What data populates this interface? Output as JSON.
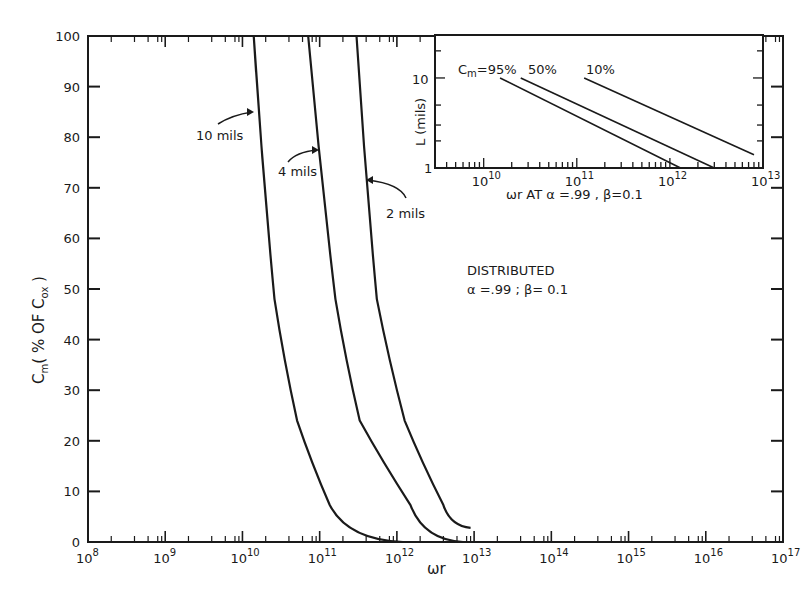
{
  "chart_data": [
    {
      "id": "main",
      "type": "line",
      "title": "",
      "xlabel": "ωr",
      "ylabel": "Cm ( % OF Cox )",
      "xscale": "log",
      "xlim": [
        100000000.0,
        1e+17
      ],
      "ylim": [
        0,
        100
      ],
      "xticks": [
        "10^8",
        "10^9",
        "10^10",
        "10^11",
        "10^12",
        "10^13",
        "10^14",
        "10^15",
        "10^16",
        "10^17"
      ],
      "yticks": [
        0,
        10,
        20,
        30,
        40,
        50,
        60,
        70,
        80,
        90,
        100
      ],
      "grid": false,
      "annotation": {
        "line1": "DISTRIBUTED",
        "line2": "α =.99 ; β= 0.1"
      },
      "series": [
        {
          "name": "10 mils",
          "points": [
            [
              14000000000.0,
              100
            ],
            [
              26000000000.0,
              48
            ],
            [
              51000000000.0,
              24
            ],
            [
              135000000000.0,
              7.3
            ],
            [
              1200000000000.0,
              0
            ]
          ]
        },
        {
          "name": "4 mils",
          "points": [
            [
              71000000000.0,
              100
            ],
            [
              160000000000.0,
              48
            ],
            [
              330000000000.0,
              24
            ],
            [
              1500000000000.0,
              7.3
            ],
            [
              7200000000000.0,
              0
            ]
          ]
        },
        {
          "name": "2 mils",
          "points": [
            [
              300000000000.0,
              100
            ],
            [
              550000000000.0,
              48
            ],
            [
              1260000000000.0,
              24
            ],
            [
              4000000000000.0,
              7.3
            ],
            [
              9000000000000.0,
              2.8
            ]
          ]
        }
      ]
    },
    {
      "id": "inset",
      "type": "line",
      "title": "",
      "xlabel": "ωr AT α =.99 , β=0.1",
      "ylabel": "L (mils)",
      "xscale": "log",
      "yscale": "log",
      "xlim": [
        3000000000.0,
        10000000000000.0
      ],
      "ylim": [
        1,
        30
      ],
      "xticks": [
        "10^10",
        "10^11",
        "10^12",
        "10^13"
      ],
      "yticks": [
        "1",
        "10"
      ],
      "series": [
        {
          "name": "Cm=95%",
          "points": [
            [
              15000000000.0,
              10
            ],
            [
              1300000000000.0,
              1
            ]
          ]
        },
        {
          "name": "50%",
          "points": [
            [
              25000000000.0,
              10
            ],
            [
              3000000000000.0,
              1
            ]
          ]
        },
        {
          "name": "10%",
          "points": [
            [
              120000000000.0,
              10
            ],
            [
              8000000000000.0,
              1.4
            ]
          ]
        }
      ]
    }
  ],
  "labels": {
    "main": {
      "yticks": [
        "0",
        "10",
        "20",
        "30",
        "40",
        "50",
        "60",
        "70",
        "80",
        "90",
        "100"
      ],
      "xticks": [
        {
          "base": "10",
          "exp": "8"
        },
        {
          "base": "10",
          "exp": "9"
        },
        {
          "base": "10",
          "exp": "10"
        },
        {
          "base": "10",
          "exp": "11"
        },
        {
          "base": "10",
          "exp": "12"
        },
        {
          "base": "10",
          "exp": "13"
        },
        {
          "base": "10",
          "exp": "14"
        },
        {
          "base": "10",
          "exp": "15"
        },
        {
          "base": "10",
          "exp": "16"
        },
        {
          "base": "10",
          "exp": "17"
        }
      ],
      "xlabel": "ωr",
      "ylabel_main": "C",
      "ylabel_sub": "m",
      "ylabel_rest": "( % OF C",
      "ylabel_sub2": "ox",
      "ylabel_end": " )",
      "curve_10": "10 mils",
      "curve_4": "4 mils",
      "curve_2": "2 mils",
      "annot1": "DISTRIBUTED",
      "annot2": "α =.99 ; β= 0.1"
    },
    "inset": {
      "ytick_1": "1",
      "ytick_10": "10",
      "xticks": [
        {
          "base": "10",
          "exp": "10"
        },
        {
          "base": "10",
          "exp": "11"
        },
        {
          "base": "10",
          "exp": "12"
        },
        {
          "base": "10",
          "exp": "13"
        }
      ],
      "ylabel": "L (mils)",
      "xlabel": "ωr AT α =.99 , β=0.1",
      "leg_c": "C",
      "leg_m": "m",
      "leg_95": "=95%",
      "leg_50": "50%",
      "leg_10": "10%"
    }
  }
}
